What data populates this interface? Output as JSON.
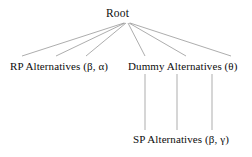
{
  "diagram": {
    "type": "tree-diagram",
    "background_color": "#ffffff",
    "line_color": "#8a8a8a",
    "text_color": "#0d0d0d",
    "nodes": [
      {
        "id": "root",
        "label": "Root",
        "x": 125,
        "y": 14
      },
      {
        "id": "rp",
        "label": "RP Alternatives (β, α)",
        "x": 63,
        "y": 67
      },
      {
        "id": "dummy",
        "label": "Dummy Alternatives (θ)",
        "x": 185,
        "y": 67
      },
      {
        "id": "sp",
        "label": "SP Alternatives (β, γ)",
        "x": 185,
        "y": 140
      }
    ],
    "edges": [
      {
        "id": "root-rp-1",
        "from": "root",
        "to": "rp",
        "x1": 124,
        "y1": 23,
        "x2": 22,
        "y2": 56
      },
      {
        "id": "root-rp-2",
        "from": "root",
        "to": "rp",
        "x1": 125,
        "y1": 23,
        "x2": 56,
        "y2": 56
      },
      {
        "id": "root-rp-3",
        "from": "root",
        "to": "rp",
        "x1": 126,
        "y1": 23,
        "x2": 86,
        "y2": 56
      },
      {
        "id": "root-sp-1",
        "from": "root",
        "to": "sp",
        "x1": 128,
        "y1": 23,
        "x2": 145,
        "y2": 56
      },
      {
        "id": "root-sp-2",
        "from": "root",
        "to": "sp",
        "x1": 129,
        "y1": 23,
        "x2": 186,
        "y2": 56
      },
      {
        "id": "root-sp-3",
        "from": "root",
        "to": "sp",
        "x1": 130,
        "y1": 23,
        "x2": 231,
        "y2": 56
      },
      {
        "id": "dummy-sp-1",
        "from": "dummy",
        "to": "sp",
        "x1": 145,
        "y1": 74,
        "x2": 145,
        "y2": 130
      },
      {
        "id": "dummy-sp-2",
        "from": "dummy",
        "to": "sp",
        "x1": 177,
        "y1": 74,
        "x2": 177,
        "y2": 130
      },
      {
        "id": "dummy-sp-3",
        "from": "dummy",
        "to": "sp",
        "x1": 212,
        "y1": 74,
        "x2": 212,
        "y2": 130
      }
    ]
  }
}
